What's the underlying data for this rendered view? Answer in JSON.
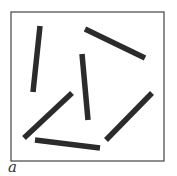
{
  "figure": {
    "panel_label": "a",
    "border_color": "#444444",
    "bar_color": "#2b2b2b",
    "box": {
      "x": 11,
      "y": 12,
      "width": 153,
      "height": 149
    },
    "bars": [
      {
        "x1": 40,
        "y1": 26,
        "x2": 33,
        "y2": 92
      },
      {
        "x1": 85,
        "y1": 29,
        "x2": 145,
        "y2": 58
      },
      {
        "x1": 82,
        "y1": 54,
        "x2": 88,
        "y2": 120
      },
      {
        "x1": 72,
        "y1": 93,
        "x2": 24,
        "y2": 138
      },
      {
        "x1": 35,
        "y1": 140,
        "x2": 100,
        "y2": 148
      },
      {
        "x1": 152,
        "y1": 93,
        "x2": 106,
        "y2": 140
      }
    ]
  }
}
